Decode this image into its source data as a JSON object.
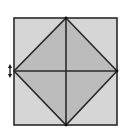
{
  "diagram": {
    "description": "Square with inscribed diamond formed by joining edge midpoints, plus horizontal and vertical midlines",
    "colors": {
      "background": "#ffffff",
      "outer_fill": "#d6d6d6",
      "diamond_fill": "#bcbcbc",
      "stroke": "#2a2a2a"
    },
    "square": {
      "x": 14,
      "y": 18,
      "width": 103,
      "height": 107
    },
    "diamond": {
      "points": [
        [
          66,
          18
        ],
        [
          117,
          71
        ],
        [
          66,
          125
        ],
        [
          14,
          71
        ]
      ]
    },
    "midlines": {
      "horizontal": [
        [
          14,
          71
        ],
        [
          117,
          71
        ]
      ],
      "vertical": [
        [
          66,
          18
        ],
        [
          66,
          125
        ]
      ]
    },
    "arrow_marker": {
      "icon": "double-vertical-arrow-icon",
      "x": 10,
      "y1": 64,
      "y2": 78
    }
  }
}
